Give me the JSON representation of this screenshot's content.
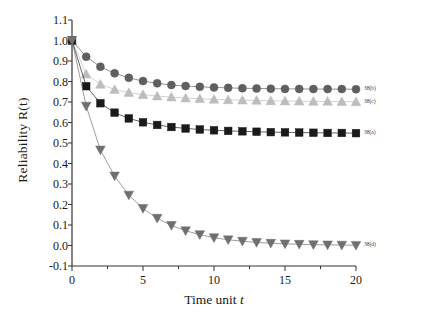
{
  "chart_data": {
    "type": "line",
    "title": "",
    "xlabel": "Time unit t",
    "ylabel": "Reliability R(t)",
    "xlim": [
      0,
      20
    ],
    "ylim": [
      -0.1,
      1.1
    ],
    "grid": false,
    "legend_position": "right-inline",
    "xticks": [
      0,
      5,
      10,
      15,
      20
    ],
    "xtick_labels": [
      "0",
      "5",
      "10",
      "15",
      "20"
    ],
    "yticks": [
      -0.1,
      0.0,
      0.1,
      0.2,
      0.3,
      0.4,
      0.5,
      0.6,
      0.7,
      0.8,
      0.9,
      1.0,
      1.1
    ],
    "ytick_labels": [
      "-0.1",
      "0.0",
      "0.1",
      "0.2",
      "0.3",
      "0.4",
      "0.5",
      "0.6",
      "0.7",
      "0.8",
      "0.9",
      "1.0",
      "1.1"
    ],
    "x": [
      0,
      1,
      2,
      3,
      4,
      5,
      6,
      7,
      8,
      9,
      10,
      11,
      12,
      13,
      14,
      15,
      16,
      17,
      18,
      19,
      20
    ],
    "series": [
      {
        "name": "38(b)",
        "marker": "circle",
        "color": "#5f5f5f",
        "values": [
          1.0,
          0.921,
          0.872,
          0.84,
          0.818,
          0.802,
          0.791,
          0.783,
          0.778,
          0.774,
          0.771,
          0.769,
          0.767,
          0.766,
          0.765,
          0.764,
          0.764,
          0.763,
          0.763,
          0.763,
          0.762
        ]
      },
      {
        "name": "38(c)",
        "marker": "triangle-up",
        "color": "#bdbdbd",
        "values": [
          1.0,
          0.836,
          0.786,
          0.761,
          0.746,
          0.736,
          0.729,
          0.724,
          0.719,
          0.716,
          0.713,
          0.711,
          0.709,
          0.708,
          0.706,
          0.705,
          0.704,
          0.703,
          0.703,
          0.702,
          0.701
        ]
      },
      {
        "name": "38(a)",
        "marker": "square",
        "color": "#1a1a1a",
        "values": [
          1.0,
          0.777,
          0.694,
          0.648,
          0.62,
          0.601,
          0.588,
          0.578,
          0.571,
          0.566,
          0.562,
          0.559,
          0.557,
          0.555,
          0.553,
          0.552,
          0.551,
          0.55,
          0.549,
          0.549,
          0.548
        ]
      },
      {
        "name": "38(d)",
        "marker": "triangle-down",
        "color": "#6f6f6f",
        "values": [
          1.0,
          0.68,
          0.466,
          0.339,
          0.246,
          0.181,
          0.133,
          0.098,
          0.072,
          0.053,
          0.038,
          0.028,
          0.021,
          0.015,
          0.011,
          0.008,
          0.006,
          0.004,
          0.003,
          0.002,
          0.001
        ]
      }
    ]
  }
}
